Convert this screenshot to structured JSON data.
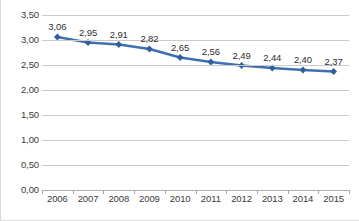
{
  "chart_data": {
    "type": "line",
    "title": "",
    "subtitle": "",
    "xlabel": "",
    "ylabel": "",
    "categories": [
      "2006",
      "2007",
      "2008",
      "2009",
      "2010",
      "2011",
      "2012",
      "2013",
      "2014",
      "2015"
    ],
    "values": [
      3.06,
      2.95,
      2.91,
      2.82,
      2.65,
      2.56,
      2.49,
      2.44,
      2.4,
      2.37
    ],
    "point_labels": [
      "3,06",
      "2,95",
      "2,91",
      "2,82",
      "2,65",
      "2,56",
      "2,49",
      "2,44",
      "2,40",
      "2,37"
    ],
    "ylim": [
      0.0,
      3.5
    ],
    "y_ticks": [
      0.0,
      0.5,
      1.0,
      1.5,
      2.0,
      2.5,
      3.0,
      3.5
    ],
    "y_tick_labels": [
      "0,00",
      "0,50",
      "1,00",
      "1,50",
      "2,00",
      "2,50",
      "3,00",
      "3,50"
    ],
    "grid": true,
    "legend": false,
    "legend_position": "none",
    "series": [
      {
        "name": "",
        "values": [
          3.06,
          2.95,
          2.91,
          2.82,
          2.65,
          2.56,
          2.49,
          2.44,
          2.4,
          2.37
        ]
      }
    ],
    "colors": {
      "line": "#3f6fad",
      "marker": "#2f5f9e",
      "gridline": "#c9c9c9",
      "axis": "#b0b0b0",
      "text": "#3a3a3a",
      "background": "#ffffff"
    },
    "marker_shape": "diamond",
    "line_width": 2.4,
    "decimal_separator": ","
  }
}
